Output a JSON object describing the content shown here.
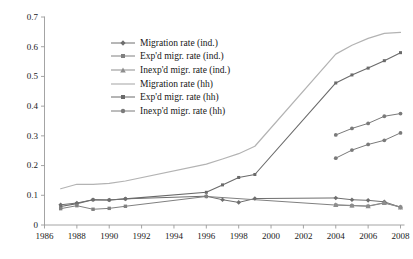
{
  "chart_data": {
    "type": "line",
    "title": "",
    "subtitle": "",
    "xlabel": "",
    "ylabel": "",
    "xlim": [
      1986,
      2008
    ],
    "ylim": [
      0,
      0.7
    ],
    "grid": false,
    "legend_position": "upper-left-inside",
    "x_ticks": [
      "1986",
      "1988",
      "1990",
      "1992",
      "1994",
      "1996",
      "1998",
      "2000",
      "2002",
      "2004",
      "2006",
      "2008"
    ],
    "x_tick_values": [
      1986,
      1988,
      1990,
      1992,
      1994,
      1996,
      1998,
      2000,
      2002,
      2004,
      2006,
      2008
    ],
    "y_ticks": [
      "0",
      "0.1",
      "0.2",
      "0.3",
      "0.4",
      "0.5",
      "0.6",
      "0.7"
    ],
    "y_tick_values": [
      0,
      0.1,
      0.2,
      0.3,
      0.4,
      0.5,
      0.6,
      0.7
    ],
    "series": [
      {
        "name": "Migration rate (ind.)",
        "color": "#6e6e6e",
        "marker": "diamond",
        "line_width": 1.0,
        "x": [
          1987,
          1988,
          1989,
          1990,
          1991,
          1996,
          1997,
          1998,
          1999,
          2004,
          2005,
          2006,
          2007,
          2008
        ],
        "y": [
          0.068,
          0.074,
          0.085,
          0.084,
          0.088,
          0.097,
          0.085,
          0.076,
          0.089,
          0.091,
          0.085,
          0.083,
          0.078,
          0.06
        ]
      },
      {
        "name": "Exp'd migr. rate (ind.)",
        "color": "#808080",
        "marker": "square",
        "line_width": 1.0,
        "x": [
          1987,
          1988,
          1989,
          1990,
          1991,
          1996,
          2004,
          2005,
          2006,
          2007,
          2008
        ],
        "y": [
          0.055,
          0.065,
          0.053,
          0.056,
          0.063,
          0.096,
          0.067,
          0.065,
          0.063,
          0.074,
          0.06
        ]
      },
      {
        "name": "Inexp'd migr. rate (ind.)",
        "color": "#8d8d8d",
        "marker": "triangle",
        "line_width": 1.0,
        "x": [
          2004,
          2005,
          2006,
          2007,
          2008
        ],
        "y": [
          0.068,
          0.066,
          0.064,
          0.075,
          0.06
        ]
      },
      {
        "name": "Migration rate (hh)",
        "color": "#b3b3b3",
        "marker": "none",
        "line_width": 1.2,
        "x": [
          1987,
          1988,
          1989,
          1990,
          1991,
          1996,
          1997,
          1998,
          1999,
          2004,
          2005,
          2006,
          2007,
          2008
        ],
        "y": [
          0.122,
          0.137,
          0.137,
          0.14,
          0.148,
          0.205,
          0.222,
          0.24,
          0.265,
          0.575,
          0.605,
          0.628,
          0.645,
          0.648
        ]
      },
      {
        "name": "Exp'd migr. rate (hh)",
        "color": "#6a6a6a",
        "marker": "square-small",
        "line_width": 1.1,
        "x": [
          1987,
          1988,
          1989,
          1990,
          1991,
          1996,
          1997,
          1998,
          1999,
          2004,
          2005,
          2006,
          2007,
          2008
        ],
        "y": [
          0.062,
          0.072,
          0.085,
          0.084,
          0.088,
          0.11,
          0.135,
          0.16,
          0.17,
          0.478,
          0.505,
          0.528,
          0.553,
          0.58
        ]
      },
      {
        "name": "Inexp'd migr. rate (hh)",
        "color": "#7a7a7a",
        "marker": "circle",
        "line_width": 1.0,
        "x": [
          2004,
          2005,
          2006,
          2007,
          2008
        ],
        "y": [
          0.225,
          0.252,
          0.271,
          0.285,
          0.31
        ]
      },
      {
        "name": "Inexp'd migr. rate (hh) upper",
        "color": "#7a7a7a",
        "marker": "circle",
        "line_width": 1.0,
        "hidden_from_legend": true,
        "x": [
          2004,
          2005,
          2006,
          2007,
          2008
        ],
        "y": [
          0.303,
          0.325,
          0.342,
          0.366,
          0.375
        ]
      }
    ]
  },
  "legend": {
    "items": [
      {
        "label": "Migration rate (ind.)",
        "marker": "diamond",
        "color": "#6e6e6e"
      },
      {
        "label": "Exp'd migr. rate (ind.)",
        "marker": "square",
        "color": "#808080"
      },
      {
        "label": "Inexp'd migr. rate (ind.)",
        "marker": "triangle",
        "color": "#8d8d8d"
      },
      {
        "label": "Migration rate (hh)",
        "marker": "none",
        "color": "#b3b3b3"
      },
      {
        "label": "Exp'd migr. rate (hh)",
        "marker": "square-small",
        "color": "#6a6a6a"
      },
      {
        "label": "Inexp'd migr. rate (hh)",
        "marker": "circle",
        "color": "#7a7a7a"
      }
    ]
  },
  "axes": {
    "axis_color": "#9a9a9a",
    "tick_color": "#9a9a9a",
    "label_color": "#1a1a1a"
  }
}
